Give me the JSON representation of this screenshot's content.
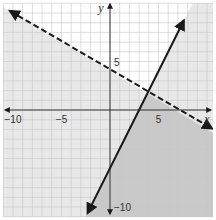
{
  "chart_data": {
    "type": "line",
    "title": "",
    "xlabel": "x",
    "ylabel": "y",
    "xlim": [
      -11,
      11
    ],
    "ylim": [
      -11,
      11
    ],
    "grid": true,
    "x_ticks": [
      {
        "value": -10,
        "label": "−10"
      },
      {
        "value": -5,
        "label": "−5"
      },
      {
        "value": 5,
        "label": "5"
      }
    ],
    "y_ticks": [
      {
        "value": 5,
        "label": "5"
      },
      {
        "value": -10,
        "label": "−10"
      }
    ],
    "series": [
      {
        "name": "dashed boundary",
        "equation": "y = -0.6x + 4",
        "style": "dashed",
        "points": [
          [
            -10.3,
            10.2
          ],
          [
            10.5,
            -1.9
          ]
        ],
        "inequality": "y < -0.6x + 4"
      },
      {
        "name": "solid boundary",
        "equation": "y = 2x - 6",
        "style": "solid",
        "points": [
          [
            -2.3,
            -10.6
          ],
          [
            7.6,
            9.2
          ]
        ],
        "inequality": "y <= 2x - 6"
      }
    ],
    "shading": {
      "light_region": "below dashed line or below solid line",
      "dark_region": "overlap of both half-planes"
    }
  },
  "colors": {
    "grid": "#c8c8c8",
    "axis": "#333333",
    "line": "#1a1a1a",
    "shade_light": "#e8e8e8",
    "shade_dark": "#c9c9c9"
  }
}
